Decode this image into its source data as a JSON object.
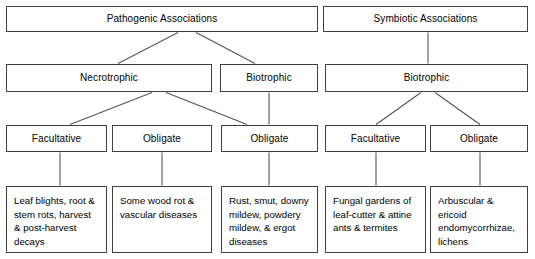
{
  "diagram": {
    "style": {
      "border_color": "#404040",
      "line_color": "#555555",
      "background": "#ffffff",
      "text_color": "#000000"
    },
    "row1": {
      "pathogenic": "Pathogenic Associations",
      "symbiotic": "Symbiotic Associations"
    },
    "row2": {
      "necrotrophic": "Necrotrophic",
      "biotrophic_pathogenic": "Biotrophic",
      "biotrophic_symbiotic": "Biotrophic"
    },
    "row3": {
      "necro_facultative": "Facultative",
      "necro_obligate": "Obligate",
      "biotroph_path_obligate": "Obligate",
      "symb_facultative": "Facultative",
      "symb_obligate": "Obligate"
    },
    "row4": {
      "necro_facultative_examples": "Leaf blights, root & stem rots, harvest & post-harvest decays",
      "necro_obligate_examples": "Some wood rot & vascular diseases",
      "biotroph_path_obligate_examples": "Rust, smut, downy mildew, powdery mildew, & ergot diseases",
      "symb_facultative_examples": "Fungal gardens of leaf-cutter & attine ants & termites",
      "symb_obligate_examples": "Arbuscular & ericoid endomycorrhizae, lichens"
    }
  }
}
